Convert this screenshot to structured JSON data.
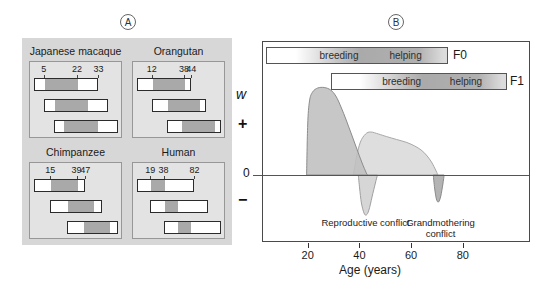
{
  "figure": {
    "panel_a_label": "A",
    "panel_b_label": "B"
  },
  "panel_a": {
    "generations_shown": 3,
    "species": [
      {
        "name": "Japanese macaque",
        "first_reproduction": 5,
        "last_reproduction": 22,
        "lifespan": 33
      },
      {
        "name": "Orangutan",
        "first_reproduction": 12,
        "last_reproduction": 38,
        "lifespan": 44
      },
      {
        "name": "Chimpanzee",
        "first_reproduction": 15,
        "last_reproduction": 39,
        "lifespan": 47
      },
      {
        "name": "Human",
        "first_reproduction": 19,
        "last_reproduction": 38,
        "lifespan": 82
      }
    ]
  },
  "panel_b": {
    "generation_bars": [
      {
        "label": "F0",
        "phases": [
          "breeding",
          "helping"
        ]
      },
      {
        "label": "F1",
        "phases": [
          "breeding",
          "helping"
        ]
      }
    ],
    "y_axis": {
      "label": "w",
      "plus": "+",
      "zero": "0",
      "minus": "−"
    },
    "x_axis": {
      "label": "Age (years)",
      "ticks": [
        20,
        40,
        60,
        80
      ]
    },
    "annotations": [
      {
        "text": "Reproductive conflict",
        "age": 42
      },
      {
        "text": "Grandmothering conflict",
        "age": 71
      }
    ]
  },
  "chart_data": [
    {
      "type": "table",
      "title": "Overlapping reproductive generations by species (panel A)",
      "columns": [
        "species",
        "age_first_reproduction",
        "age_last_reproduction",
        "lifespan"
      ],
      "rows": [
        [
          "Japanese macaque",
          5,
          22,
          33
        ],
        [
          "Orangutan",
          12,
          38,
          44
        ],
        [
          "Chimpanzee",
          15,
          39,
          47
        ],
        [
          "Human",
          19,
          38,
          82
        ]
      ],
      "note": "Three stacked generation bars per species, each offset by the age at first reproduction; gray segment marks the reproductive period."
    },
    {
      "type": "area",
      "title": "Fitness (w) versus age with intergenerational conflicts (panel B)",
      "xlabel": "Age (years)",
      "ylabel": "w",
      "x_ticks": [
        20,
        40,
        60,
        80
      ],
      "xlim": [
        2,
        105
      ],
      "ylim_w": [
        -0.6,
        1.2
      ],
      "grid": false,
      "px_map": {
        "px_per_year": 2.585,
        "x_offset_px": -6,
        "zero_y_px": 133,
        "w_scale_px": 100
      },
      "series": [
        {
          "name": "f1-fitness-hump",
          "fill": "#dedede",
          "stroke": "#a8a8a8",
          "opacity": 1,
          "points": [
            [
              37.3,
              0
            ],
            [
              38.5,
              0.18
            ],
            [
              40,
              0.33
            ],
            [
              42,
              0.41
            ],
            [
              44,
              0.43
            ],
            [
              47,
              0.41
            ],
            [
              50,
              0.385
            ],
            [
              54,
              0.355
            ],
            [
              58,
              0.325
            ],
            [
              61,
              0.29
            ],
            [
              63.5,
              0.25
            ],
            [
              65.5,
              0.2
            ],
            [
              67.5,
              0.13
            ],
            [
              69.3,
              0.04
            ],
            [
              70,
              0
            ]
          ]
        },
        {
          "name": "reproductive-conflict-dip",
          "fill": "#d6d6d6",
          "stroke": "#a0a0a0",
          "opacity": 1,
          "points": [
            [
              39.2,
              0
            ],
            [
              39.7,
              -0.13
            ],
            [
              40.4,
              -0.28
            ],
            [
              41.4,
              -0.38
            ],
            [
              42.3,
              -0.4
            ],
            [
              43.3,
              -0.35
            ],
            [
              44.5,
              -0.22
            ],
            [
              45.8,
              -0.08
            ],
            [
              46.6,
              0
            ]
          ]
        },
        {
          "name": "grandmothering-conflict-dip",
          "fill": "#b4b4b4",
          "stroke": "#8a8a8a",
          "opacity": 1,
          "points": [
            [
              68.2,
              0
            ],
            [
              68.7,
              -0.13
            ],
            [
              69.4,
              -0.24
            ],
            [
              70.2,
              -0.27
            ],
            [
              71.1,
              -0.21
            ],
            [
              71.9,
              -0.09
            ],
            [
              72.4,
              0
            ]
          ]
        },
        {
          "name": "f0-fitness-hump",
          "fill": "#bfbfbf",
          "stroke": "#8c8c8c",
          "opacity": 0.88,
          "points": [
            [
              19.2,
              0
            ],
            [
              19.6,
              0.5
            ],
            [
              20.3,
              0.74
            ],
            [
              21.5,
              0.83
            ],
            [
              23.5,
              0.87
            ],
            [
              26,
              0.875
            ],
            [
              28.5,
              0.85
            ],
            [
              30.5,
              0.79
            ],
            [
              32.5,
              0.68
            ],
            [
              34.5,
              0.55
            ],
            [
              36.5,
              0.41
            ],
            [
              38.5,
              0.27
            ],
            [
              40.5,
              0.13
            ],
            [
              42.3,
              0.02
            ],
            [
              42.8,
              0
            ]
          ]
        }
      ],
      "annotations": [
        {
          "text": "Reproductive conflict",
          "age": 42
        },
        {
          "text": "Grandmothering conflict",
          "age": 71
        }
      ]
    }
  ]
}
